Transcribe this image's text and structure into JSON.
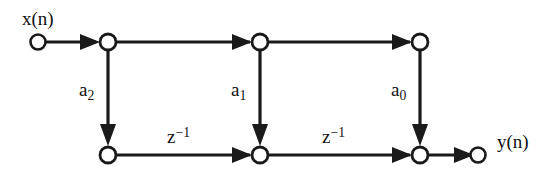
{
  "diagram": {
    "stroke_color": "#1a1a1a",
    "node_fill": "#ffffff",
    "background": "#ffffff",
    "input": {
      "label_text": "x(n)",
      "node_name": "input-node"
    },
    "output": {
      "label_text": "y(n)",
      "node_name": "output-node"
    },
    "coefficients": [
      {
        "id": "a2",
        "base": "a",
        "subscript": "2"
      },
      {
        "id": "a1",
        "base": "a",
        "subscript": "1"
      },
      {
        "id": "a0",
        "base": "a",
        "subscript": "0"
      }
    ],
    "delays": [
      {
        "id": "z1",
        "base": "z",
        "superscript": "−1"
      },
      {
        "id": "z2",
        "base": "z",
        "superscript": "−1"
      }
    ],
    "nodes": [
      {
        "id": "in",
        "x": 38,
        "y": 42,
        "kind": "open"
      },
      {
        "id": "t1",
        "x": 108,
        "y": 42,
        "kind": "open"
      },
      {
        "id": "t2",
        "x": 260,
        "y": 42,
        "kind": "open"
      },
      {
        "id": "t3",
        "x": 420,
        "y": 42,
        "kind": "open"
      },
      {
        "id": "b1",
        "x": 108,
        "y": 155,
        "kind": "open"
      },
      {
        "id": "b2",
        "x": 260,
        "y": 155,
        "kind": "open"
      },
      {
        "id": "b3",
        "x": 420,
        "y": 155,
        "kind": "open"
      },
      {
        "id": "out",
        "x": 478,
        "y": 155,
        "kind": "open"
      }
    ],
    "edges": [
      {
        "id": "e-in-t1",
        "from": "in",
        "to": "t1",
        "orientation": "horizontal"
      },
      {
        "id": "e-t1-t2",
        "from": "t1",
        "to": "t2",
        "orientation": "horizontal"
      },
      {
        "id": "e-t2-t3",
        "from": "t2",
        "to": "t3",
        "orientation": "horizontal"
      },
      {
        "id": "e-t1-b1",
        "from": "t1",
        "to": "b1",
        "orientation": "vertical"
      },
      {
        "id": "e-t2-b2",
        "from": "t2",
        "to": "b2",
        "orientation": "vertical"
      },
      {
        "id": "e-t3-b3",
        "from": "t3",
        "to": "b3",
        "orientation": "vertical"
      },
      {
        "id": "e-b1-b2",
        "from": "b1",
        "to": "b2",
        "orientation": "horizontal"
      },
      {
        "id": "e-b2-b3",
        "from": "b2",
        "to": "b3",
        "orientation": "horizontal"
      },
      {
        "id": "e-b3-out",
        "from": "b3",
        "to": "out",
        "orientation": "horizontal"
      }
    ]
  }
}
